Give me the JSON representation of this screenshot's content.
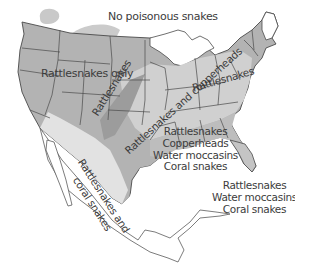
{
  "map": {
    "title": "Venomous snake regions of the United States",
    "colors": {
      "background": "#ffffff",
      "border": "#4a4a4a",
      "no_venomous_tint": "#c9c9c9",
      "rattlesnakes_only": "#b3b3b3",
      "rattlesnakes_dark_band": "#9c9c9c",
      "rattlesnakes_and_copperheads": "#d2d2d2",
      "southeast": "#bdbdbd",
      "rattlesnakes_and_coral": "#e2e2e2",
      "water": "#ffffff"
    },
    "labels": {
      "no_poisonous": "No poisonous snakes",
      "rattlesnakes_only": "Rattlesnakes only",
      "rattlesnakes_band": "Rattlesnakes",
      "rattle_copper_line1": "Rattlesnakes",
      "rattle_copper_line2": "and copperheads",
      "rattle_copper_diag": "Rattlesnakes and copperheads",
      "southeast": {
        "line1": "Rattlesnakes",
        "line2": "Copperheads",
        "line3": "Water moccasins",
        "line4": "Coral snakes"
      },
      "florida": {
        "line1": "Rattlesnakes",
        "line2": "Water moccasins",
        "line3": "Coral snakes"
      },
      "southwest": {
        "line1": "Rattlesnakes and",
        "line2": "coral snakes"
      }
    }
  }
}
